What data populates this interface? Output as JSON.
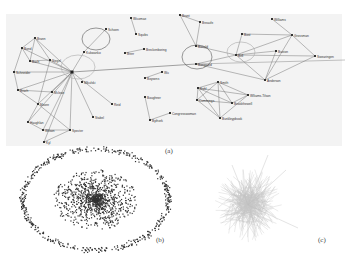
{
  "figure": {
    "panels": [
      {
        "id": "a",
        "caption": "(a)",
        "type": "node-link graph with labeled nodes and highlight ellipses",
        "nodes": [
          {
            "label": "Brann",
            "x": 35,
            "y": 38
          },
          {
            "label": "Bond",
            "x": 22,
            "y": 48
          },
          {
            "label": "Bach",
            "x": 30,
            "y": 61
          },
          {
            "label": "Siegel",
            "x": 50,
            "y": 60
          },
          {
            "label": "Schneider",
            "x": 14,
            "y": 72
          },
          {
            "label": "Brach",
            "x": 18,
            "y": 90
          },
          {
            "label": "Mclean",
            "x": 52,
            "y": 92
          },
          {
            "label": "Moore",
            "x": 38,
            "y": 104
          },
          {
            "label": "Haughlan",
            "x": 28,
            "y": 122
          },
          {
            "label": "Wilson",
            "x": 43,
            "y": 130
          },
          {
            "label": "Specter",
            "x": 70,
            "y": 130
          },
          {
            "label": "Kyl",
            "x": 44,
            "y": 142
          },
          {
            "label": "Mikulski",
            "x": 82,
            "y": 82
          },
          {
            "label": "Reid",
            "x": 112,
            "y": 104
          },
          {
            "label": "Stabel",
            "x": 93,
            "y": 117
          },
          {
            "label": "Kukwanko",
            "x": 84,
            "y": 52
          },
          {
            "label": "Schoen",
            "x": 106,
            "y": 29
          },
          {
            "label": "Wicomae",
            "x": 131,
            "y": 18
          },
          {
            "label": "Squibs",
            "x": 136,
            "y": 34
          },
          {
            "label": "Brerr",
            "x": 125,
            "y": 53
          },
          {
            "label": "Breckenboring",
            "x": 144,
            "y": 49
          },
          {
            "label": "Wu",
            "x": 162,
            "y": 72
          },
          {
            "label": "Boysens",
            "x": 145,
            "y": 78
          },
          {
            "label": "Boughner",
            "x": 145,
            "y": 97
          },
          {
            "label": "Congresswoman",
            "x": 170,
            "y": 113
          },
          {
            "label": "Bythork",
            "x": 150,
            "y": 120
          },
          {
            "label": "Brant",
            "x": 180,
            "y": 15
          },
          {
            "label": "Breaufe",
            "x": 200,
            "y": 22
          },
          {
            "label": "Bonald",
            "x": 196,
            "y": 46
          },
          {
            "label": "Bongaard",
            "x": 196,
            "y": 64
          },
          {
            "label": "Bost",
            "x": 242,
            "y": 34
          },
          {
            "label": "Bell",
            "x": 236,
            "y": 55
          },
          {
            "label": "Buxton",
            "x": 276,
            "y": 51
          },
          {
            "label": "Williams",
            "x": 272,
            "y": 19
          },
          {
            "label": "Grossman",
            "x": 292,
            "y": 35
          },
          {
            "label": "Swearingen",
            "x": 315,
            "y": 56
          },
          {
            "label": "Anderson",
            "x": 265,
            "y": 80
          },
          {
            "label": "Smith",
            "x": 218,
            "y": 82
          },
          {
            "label": "Kuhl",
            "x": 198,
            "y": 88
          },
          {
            "label": "Cummings",
            "x": 197,
            "y": 100
          },
          {
            "label": "Wlliams-Tilson",
            "x": 248,
            "y": 95
          },
          {
            "label": "Brookthewell",
            "x": 232,
            "y": 103
          },
          {
            "label": "Bunkleypbook",
            "x": 220,
            "y": 118
          }
        ]
      },
      {
        "id": "b",
        "caption": "(b)",
        "type": "scatter layout: dense central cluster surrounded by a ring of isolated nodes"
      },
      {
        "id": "c",
        "caption": "(c)",
        "type": "light gray hairball network layout"
      }
    ]
  }
}
